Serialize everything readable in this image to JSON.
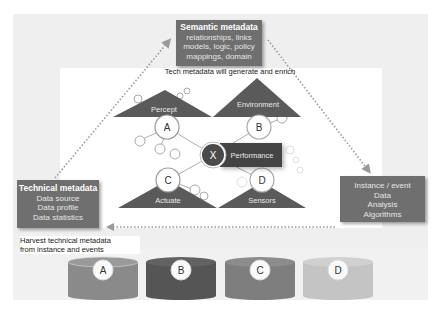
{
  "semantic_box": {
    "title": "Semantic metadata",
    "lines": [
      "relationships, links",
      "models, logic, policy",
      "mappings, domain"
    ]
  },
  "technical_box": {
    "title": "Technical metadata",
    "lines": [
      "Data source",
      "Data profile",
      "Data statistics"
    ]
  },
  "instance_box": {
    "lines": [
      "Instance / event",
      "Data",
      "Analysis",
      "Algorithms"
    ]
  },
  "captions": {
    "generate": "Tech metadata will generate and enrich",
    "harvest_line1": "Harvest technical metadata",
    "harvest_line2": "from instance and events"
  },
  "network": {
    "triangles": [
      {
        "label": "Percept"
      },
      {
        "label": "Environment"
      },
      {
        "label": "Actuate"
      },
      {
        "label": "Sensors"
      }
    ],
    "nodes": [
      {
        "label": "A"
      },
      {
        "label": "B"
      },
      {
        "label": "C"
      },
      {
        "label": "D"
      }
    ],
    "center_node": {
      "label": "X",
      "tag": "Performance"
    }
  },
  "cylinders": [
    {
      "label": "A",
      "color": "#8a8a8a"
    },
    {
      "label": "B",
      "color": "#555555"
    },
    {
      "label": "C",
      "color": "#7e7e7e"
    },
    {
      "label": "D",
      "color": "#c4c4c4"
    }
  ],
  "colors": {
    "box_fill": "#6f6f6f",
    "triangle_fill": "#5a5a5a",
    "frame": "#efefef",
    "dotted_arrow": "#9a9a9a"
  }
}
